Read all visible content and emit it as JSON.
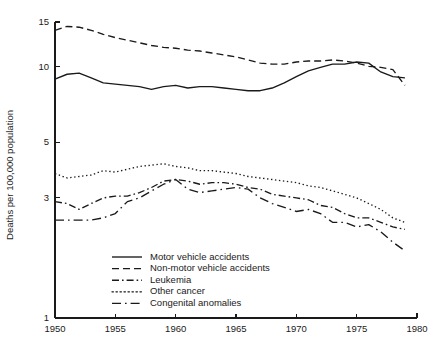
{
  "chart_data": {
    "type": "line",
    "title": "",
    "xlabel": "",
    "ylabel": "Deaths per 100,000 population",
    "yscale": "log",
    "ylim": [
      1,
      15
    ],
    "xlim": [
      1950,
      1980
    ],
    "grid": false,
    "legend_position": "inside-bottom-center",
    "y_ticks": [
      1,
      3,
      5,
      10,
      15
    ],
    "y_tick_labels": [
      "1",
      "3",
      "5",
      "10",
      "15"
    ],
    "x_ticks": [
      1950,
      1955,
      1960,
      1965,
      1970,
      1975,
      1980
    ],
    "x_tick_labels": [
      "1950",
      "1955",
      "1960",
      "1965",
      "1970",
      "1975",
      "1980"
    ],
    "x": [
      1950,
      1951,
      1952,
      1953,
      1954,
      1955,
      1956,
      1957,
      1958,
      1959,
      1960,
      1961,
      1962,
      1963,
      1964,
      1965,
      1966,
      1967,
      1968,
      1969,
      1970,
      1971,
      1972,
      1973,
      1974,
      1975,
      1976,
      1977,
      1978,
      1979
    ],
    "series": [
      {
        "name": "Motor vehicle accidents",
        "style": "solid",
        "values": [
          8.9,
          9.3,
          9.4,
          9.0,
          8.6,
          8.5,
          8.4,
          8.3,
          8.1,
          8.3,
          8.4,
          8.2,
          8.3,
          8.3,
          8.2,
          8.1,
          8.0,
          8.0,
          8.2,
          8.6,
          9.1,
          9.6,
          9.9,
          10.2,
          10.2,
          10.4,
          10.3,
          9.5,
          9.1,
          9.0
        ]
      },
      {
        "name": "Non-motor vehicle accidents",
        "style": "dashed",
        "values": [
          13.9,
          14.4,
          14.3,
          13.9,
          13.4,
          13.0,
          12.7,
          12.4,
          12.1,
          11.9,
          11.8,
          11.6,
          11.5,
          11.3,
          11.1,
          10.9,
          10.6,
          10.3,
          10.2,
          10.2,
          10.4,
          10.5,
          10.5,
          10.6,
          10.5,
          10.3,
          10.0,
          9.9,
          9.7,
          8.4
        ]
      },
      {
        "name": "Leukemia",
        "style": "dashdot",
        "values": [
          2.9,
          2.85,
          2.7,
          2.85,
          3.0,
          3.05,
          3.05,
          3.15,
          3.3,
          3.5,
          3.55,
          3.5,
          3.4,
          3.45,
          3.45,
          3.4,
          3.3,
          3.25,
          3.1,
          3.05,
          3.0,
          2.95,
          2.8,
          2.75,
          2.6,
          2.5,
          2.5,
          2.4,
          2.3,
          2.25
        ]
      },
      {
        "name": "Other cancer",
        "style": "dotted",
        "values": [
          3.75,
          3.6,
          3.65,
          3.7,
          3.85,
          3.8,
          3.9,
          4.0,
          4.05,
          4.1,
          4.0,
          3.95,
          3.85,
          3.85,
          3.8,
          3.75,
          3.65,
          3.6,
          3.55,
          3.5,
          3.45,
          3.35,
          3.3,
          3.2,
          3.1,
          3.0,
          2.85,
          2.7,
          2.5,
          2.4
        ]
      },
      {
        "name": "Congenital anomalies",
        "style": "longdash",
        "values": [
          2.45,
          2.45,
          2.45,
          2.45,
          2.5,
          2.6,
          2.9,
          3.0,
          3.2,
          3.4,
          3.55,
          3.25,
          3.15,
          3.2,
          3.25,
          3.3,
          3.25,
          3.0,
          2.85,
          2.75,
          2.65,
          2.7,
          2.6,
          2.4,
          2.4,
          2.3,
          2.35,
          2.2,
          2.0,
          1.85
        ]
      }
    ]
  },
  "legend": {
    "items": [
      {
        "label": "Motor vehicle accidents",
        "style": "solid"
      },
      {
        "label": "Non-motor vehicle accidents",
        "style": "dashed"
      },
      {
        "label": "Leukemia",
        "style": "dashdot"
      },
      {
        "label": "Other cancer",
        "style": "dotted"
      },
      {
        "label": "Congenital anomalies",
        "style": "longdash"
      }
    ]
  }
}
